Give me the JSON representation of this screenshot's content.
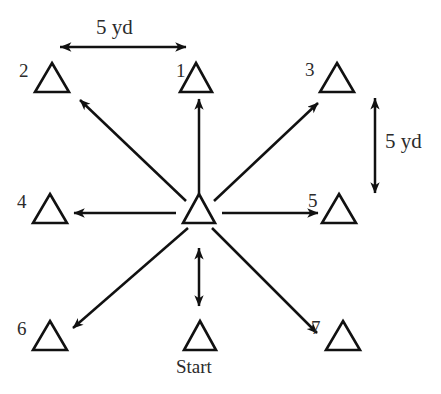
{
  "diagram": {
    "stroke_color": "#111111",
    "background_color": "#ffffff",
    "cones": [
      {
        "id": "start",
        "label": "Start",
        "label_kind": "text",
        "cx": 200,
        "cy": 336,
        "size": 30
      },
      {
        "id": "center",
        "label": "",
        "label_kind": "none",
        "cx": 199,
        "cy": 209,
        "size": 30
      },
      {
        "id": "cone-1",
        "label": "1",
        "label_kind": "number",
        "cx": 196,
        "cy": 78,
        "size": 30
      },
      {
        "id": "cone-2",
        "label": "2",
        "label_kind": "number",
        "cx": 52,
        "cy": 78,
        "size": 32
      },
      {
        "id": "cone-3",
        "label": "3",
        "label_kind": "number",
        "cx": 337,
        "cy": 78,
        "size": 32
      },
      {
        "id": "cone-4",
        "label": "4",
        "label_kind": "number",
        "cx": 50,
        "cy": 209,
        "size": 32
      },
      {
        "id": "cone-5",
        "label": "5",
        "label_kind": "number",
        "cx": 339,
        "cy": 209,
        "size": 32
      },
      {
        "id": "cone-6",
        "label": "6",
        "label_kind": "number",
        "cx": 50,
        "cy": 336,
        "size": 32
      },
      {
        "id": "cone-7",
        "label": "7",
        "label_kind": "number",
        "cx": 343,
        "cy": 336,
        "size": 32
      }
    ],
    "arrows": [
      {
        "id": "arrow-center-to-1",
        "from": "center",
        "to": "cone-1",
        "heads": "single"
      },
      {
        "id": "arrow-center-to-2",
        "from": "center",
        "to": "cone-2",
        "heads": "single"
      },
      {
        "id": "arrow-center-to-3",
        "from": "center",
        "to": "cone-3",
        "heads": "single"
      },
      {
        "id": "arrow-center-to-4",
        "from": "center",
        "to": "cone-4",
        "heads": "single"
      },
      {
        "id": "arrow-center-to-5",
        "from": "center",
        "to": "cone-5",
        "heads": "single"
      },
      {
        "id": "arrow-center-to-6",
        "from": "center",
        "to": "cone-6",
        "heads": "single"
      },
      {
        "id": "arrow-center-to-7",
        "from": "center",
        "to": "cone-7",
        "heads": "single"
      },
      {
        "id": "arrow-center-to-start",
        "from": "center",
        "to": "start",
        "heads": "double"
      }
    ],
    "dimensions": [
      {
        "id": "dim-horizontal",
        "label": "5 yd",
        "orientation": "horizontal",
        "heads": "double"
      },
      {
        "id": "dim-vertical",
        "label": "5 yd",
        "orientation": "vertical",
        "heads": "double"
      }
    ]
  }
}
